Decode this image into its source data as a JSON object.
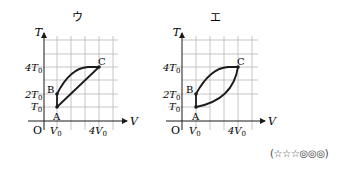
{
  "panels": [
    {
      "label": "ウ",
      "axis_x_label": "V",
      "axis_y_label": "T",
      "origin_label": "O",
      "x_ticks": [
        {
          "label": "V",
          "sub": "0"
        },
        {
          "label": "4V",
          "sub": "0"
        }
      ],
      "y_ticks": [
        {
          "label": "4T",
          "sub": "0"
        },
        {
          "label": "2T",
          "sub": "0"
        },
        {
          "label": "T",
          "sub": "0"
        }
      ],
      "points": [
        {
          "name": "A",
          "V": 1,
          "T": 1
        },
        {
          "name": "B",
          "V": 1,
          "T": 2
        },
        {
          "name": "C",
          "V": 4,
          "T": 4
        }
      ],
      "paths": [
        "A→B vertical line",
        "B→C concave curve",
        "C→A straight line"
      ]
    },
    {
      "label": "エ",
      "axis_x_label": "V",
      "axis_y_label": "T",
      "origin_label": "O",
      "x_ticks": [
        {
          "label": "V",
          "sub": "0"
        },
        {
          "label": "4V",
          "sub": "0"
        }
      ],
      "y_ticks": [
        {
          "label": "4T",
          "sub": "0"
        },
        {
          "label": "2T",
          "sub": "0"
        },
        {
          "label": "T",
          "sub": "0"
        }
      ],
      "points": [
        {
          "name": "A",
          "V": 1,
          "T": 1
        },
        {
          "name": "B",
          "V": 1,
          "T": 2
        },
        {
          "name": "C",
          "V": 4,
          "T": 4
        }
      ],
      "paths": [
        "A→B vertical line",
        "B→C concave curve",
        "C→A convex curve"
      ]
    }
  ],
  "rating": "(☆☆☆◎◎◎)",
  "colors": {
    "grid": "#b8b8b8",
    "line": "#1a1a1a",
    "background": "#ffffff"
  }
}
